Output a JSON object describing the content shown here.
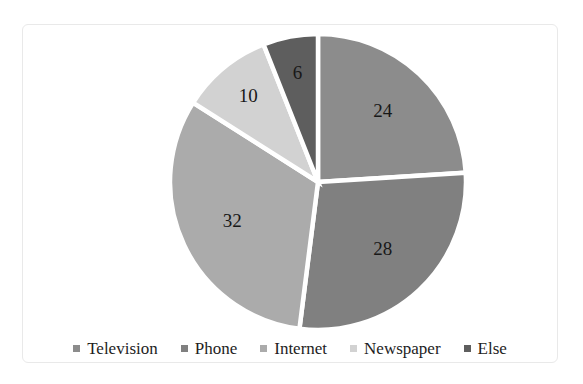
{
  "chart_data": {
    "type": "pie",
    "title": "",
    "subtitle": "",
    "xlabel": "",
    "ylabel": "",
    "grid": false,
    "legend_position": "bottom",
    "start_angle_deg": 0,
    "direction": "clockwise",
    "total": 100,
    "categories": [
      "Television",
      "Phone",
      "Internet",
      "Newspaper",
      "Else"
    ],
    "values": [
      24,
      28,
      32,
      10,
      6
    ],
    "labels": [
      "24",
      "28",
      "32",
      "10",
      "6"
    ],
    "colors": [
      "#8c8c8c",
      "#808080",
      "#ababab",
      "#d2d2d2",
      "#5e5e5e"
    ],
    "slices": [
      {
        "name": "Television",
        "value": 24,
        "label": "24",
        "color": "#8c8c8c"
      },
      {
        "name": "Phone",
        "value": 28,
        "label": "28",
        "color": "#808080"
      },
      {
        "name": "Internet",
        "value": 32,
        "label": "32",
        "color": "#ababab"
      },
      {
        "name": "Newspaper",
        "value": 10,
        "label": "10",
        "color": "#d2d2d2"
      },
      {
        "name": "Else",
        "value": 6,
        "label": "6",
        "color": "#5e5e5e"
      }
    ]
  },
  "legend": {
    "items": [
      {
        "label": "Television",
        "color": "#8c8c8c"
      },
      {
        "label": "Phone",
        "color": "#808080"
      },
      {
        "label": "Internet",
        "color": "#ababab"
      },
      {
        "label": "Newspaper",
        "color": "#d2d2d2"
      },
      {
        "label": "Else",
        "color": "#5e5e5e"
      }
    ]
  },
  "geometry": {
    "center_x": 318,
    "center_y": 182,
    "radius": 148,
    "separator_color": "#ffffff",
    "separator_width": 4.5,
    "label_radius_ratio": 0.64,
    "background": "#ffffff",
    "frame_color": "#e9e9e9"
  }
}
